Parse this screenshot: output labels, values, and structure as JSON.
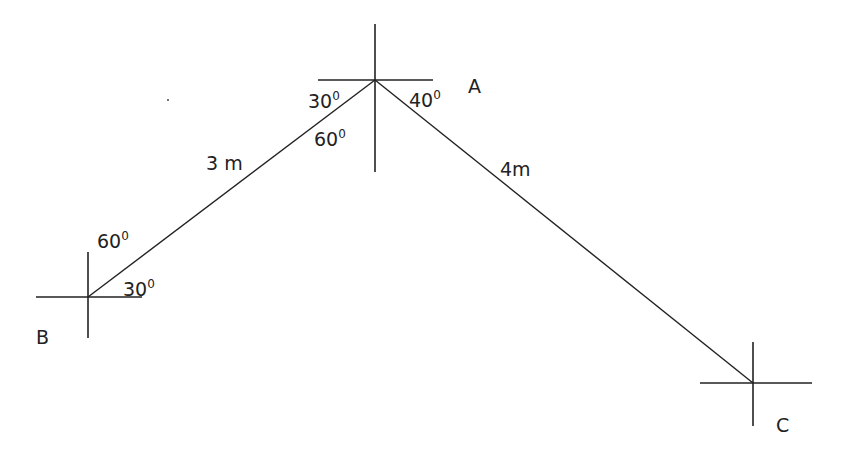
{
  "diagram": {
    "points": {
      "A": {
        "label": "A",
        "x": 375,
        "y": 80
      },
      "B": {
        "label": "B",
        "x": 88,
        "y": 297
      },
      "C": {
        "label": "C",
        "x": 753,
        "y": 383
      }
    },
    "segments": [
      {
        "from": "B",
        "to": "A",
        "length_label": "3 m"
      },
      {
        "from": "A",
        "to": "C",
        "length_label": "4m"
      }
    ],
    "angles": {
      "A_left_upper": {
        "value": "30",
        "unit": "0"
      },
      "A_left_lower": {
        "value": "60",
        "unit": "0"
      },
      "A_right": {
        "value": "40",
        "unit": "0"
      },
      "B_upper": {
        "value": "60",
        "unit": "0"
      },
      "B_lower": {
        "value": "30",
        "unit": "0"
      }
    },
    "line_color": "#222222"
  }
}
